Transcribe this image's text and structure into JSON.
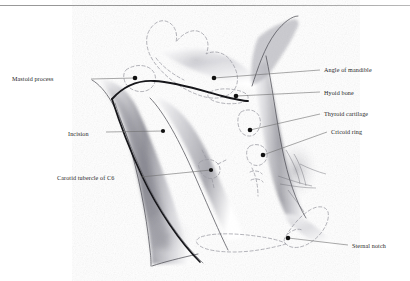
{
  "figure": {
    "kind": "anatomical-illustration",
    "background_color": "#ffffff",
    "ink_color": "#1d1d1d",
    "dashed_outline_color": "#9a9aa2",
    "leader_line_color": "#6f6f6f",
    "marker_color": "#111111",
    "shading_color": "#5b5b61"
  },
  "top_rule": {
    "present": true,
    "color": "#9a9a9a"
  },
  "labels": [
    {
      "id": "mastoid-process",
      "text": "Mastoid process",
      "side": "left",
      "x": 12,
      "y": 76
    },
    {
      "id": "incision",
      "text": "Incision",
      "side": "left",
      "x": 68,
      "y": 131
    },
    {
      "id": "carotid-tubercle-c6",
      "text": "Carotid tubercle of C6",
      "side": "left",
      "x": 57,
      "y": 175
    },
    {
      "id": "angle-of-mandible",
      "text": "Angle of mandible",
      "side": "right",
      "x": 324,
      "y": 67
    },
    {
      "id": "hyoid-bone",
      "text": "Hyoid bone",
      "side": "right",
      "x": 324,
      "y": 90
    },
    {
      "id": "thyroid-cartilage",
      "text": "Thyroid cartilage",
      "side": "right",
      "x": 324,
      "y": 111
    },
    {
      "id": "cricoid-ring",
      "text": "Cricoid ring",
      "side": "right",
      "x": 331,
      "y": 129
    },
    {
      "id": "sternal-notch",
      "text": "Sternal notch",
      "side": "right",
      "x": 352,
      "y": 243
    }
  ],
  "markers": [
    {
      "id": "marker-mastoid-process",
      "x": 135,
      "y": 78
    },
    {
      "id": "marker-angle-of-mandible",
      "x": 214,
      "y": 78
    },
    {
      "id": "marker-hyoid-bone",
      "x": 236,
      "y": 96
    },
    {
      "id": "marker-thyroid-cartilage",
      "x": 250,
      "y": 130
    },
    {
      "id": "marker-cricoid-ring",
      "x": 263,
      "y": 155
    },
    {
      "id": "marker-incision",
      "x": 163,
      "y": 131
    },
    {
      "id": "marker-carotid-tubercle",
      "x": 211,
      "y": 170
    },
    {
      "id": "marker-sternal-notch",
      "x": 288,
      "y": 238
    }
  ],
  "leaders": [
    {
      "id": "leader-mastoid-process",
      "from": [
        91,
        79
      ],
      "to": [
        135,
        78
      ]
    },
    {
      "id": "leader-incision",
      "from": [
        106,
        132
      ],
      "to": [
        163,
        131
      ]
    },
    {
      "id": "leader-carotid-tubercle",
      "from": [
        141,
        177
      ],
      "to": [
        211,
        170
      ]
    },
    {
      "id": "leader-angle-of-mandible",
      "from": [
        214,
        78
      ],
      "to": [
        320,
        70
      ]
    },
    {
      "id": "leader-hyoid-bone",
      "from": [
        236,
        96
      ],
      "to": [
        320,
        92
      ]
    },
    {
      "id": "leader-thyroid-cartilage",
      "from": [
        250,
        130
      ],
      "to": [
        320,
        114
      ]
    },
    {
      "id": "leader-cricoid-ring",
      "from": [
        263,
        155
      ],
      "to": [
        327,
        132
      ]
    },
    {
      "id": "leader-sternal-notch",
      "from": [
        288,
        238
      ],
      "to": [
        348,
        245
      ]
    }
  ]
}
